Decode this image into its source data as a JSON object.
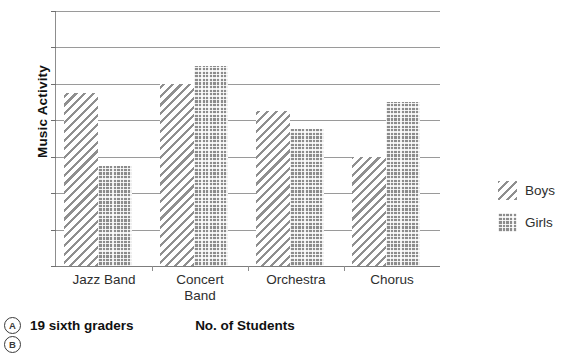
{
  "chart_data": {
    "type": "bar",
    "title": "",
    "xlabel": "No. of Students",
    "ylabel": "Music Activity",
    "categories": [
      "Jazz Band",
      "Concert Band",
      "Orchestra",
      "Chorus"
    ],
    "category_lines": [
      [
        "Jazz Band"
      ],
      [
        "Concert",
        "Band"
      ],
      [
        "Orchestra"
      ],
      [
        "Chorus"
      ]
    ],
    "series": [
      {
        "name": "Boys",
        "values": [
          19,
          20,
          17,
          12
        ],
        "pattern": "diagonal-hatch",
        "color": "#8f8f8f"
      },
      {
        "name": "Girls",
        "values": [
          11,
          22,
          15,
          18
        ],
        "pattern": "dotted-grid",
        "color": "#8c8c8c"
      }
    ],
    "ylim": [
      0,
      28
    ],
    "yticks": [
      0,
      4,
      8,
      12,
      16,
      20,
      24,
      28
    ],
    "ytick_labels": [
      "0",
      "4",
      "8",
      "12",
      "16",
      "20",
      "24",
      "28"
    ],
    "grid": true,
    "legend_position": "right"
  },
  "legend": {
    "entries": [
      {
        "label": "Boys",
        "swatch": "diagonal-hatch-swatch"
      },
      {
        "label": "Girls",
        "swatch": "dotted-grid-swatch"
      }
    ]
  },
  "answers": {
    "options": [
      {
        "letter": "A",
        "text": "19 sixth graders"
      },
      {
        "letter": "B",
        "text": ""
      }
    ]
  }
}
